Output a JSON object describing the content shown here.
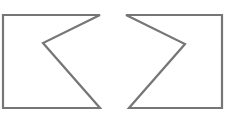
{
  "diagram": {
    "background": "#ffffff",
    "stroke_color": "#767676",
    "stroke_width": 2.2,
    "shapes": [
      {
        "id": "left-notched-flag",
        "points": "3,15 100,15 43,43 100,108 3,108"
      },
      {
        "id": "right-notched-flag",
        "points": "126,15 222,15 222,108 129,108 185,44"
      }
    ]
  }
}
